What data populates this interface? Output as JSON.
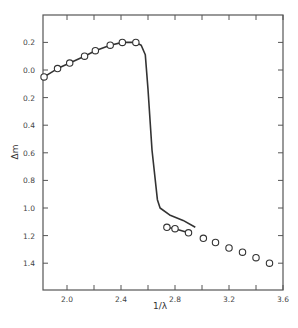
{
  "chart_data": {
    "type": "line",
    "title": "",
    "xlabel": "1/λ",
    "ylabel": "Δm",
    "xlim": [
      1.82,
      3.6
    ],
    "ylim": [
      -0.4,
      1.6
    ],
    "y_inverted": true,
    "grid": false,
    "legend": null,
    "x_ticks": [
      2.0,
      2.2,
      2.4,
      2.6,
      2.8,
      3.0,
      3.2,
      3.4,
      3.6
    ],
    "x_tick_labels": [
      "2.0",
      "2.4",
      "2.8",
      "3.2",
      "3.6"
    ],
    "y_ticks": [
      -0.2,
      0.0,
      0.2,
      0.4,
      0.6,
      0.8,
      1.0,
      1.2,
      1.4
    ],
    "y_tick_labels": [
      "0.2",
      "0.0",
      "0.2",
      "0.4",
      "0.6",
      "0.8",
      "1.0",
      "1.2",
      "1.4"
    ],
    "series": [
      {
        "name": "observed-points",
        "style": "open-circles",
        "x": [
          1.83,
          1.93,
          2.02,
          2.13,
          2.21,
          2.32,
          2.41,
          2.51,
          2.74,
          2.8,
          2.9,
          3.01,
          3.1,
          3.2,
          3.3,
          3.4,
          3.5
        ],
        "y": [
          0.05,
          -0.01,
          -0.05,
          -0.1,
          -0.14,
          -0.18,
          -0.2,
          -0.2,
          1.14,
          1.15,
          1.18,
          1.22,
          1.25,
          1.29,
          1.32,
          1.36,
          1.4
        ]
      },
      {
        "name": "fit-curve-low",
        "style": "solid-line",
        "x": [
          1.83,
          1.93,
          2.02,
          2.13,
          2.21,
          2.32,
          2.41,
          2.51
        ],
        "y": [
          0.05,
          -0.01,
          -0.05,
          -0.1,
          -0.14,
          -0.18,
          -0.2,
          -0.2
        ]
      },
      {
        "name": "model-curve",
        "style": "solid-line",
        "x": [
          2.51,
          2.55,
          2.58,
          2.6,
          2.63,
          2.67,
          2.69,
          2.76,
          2.86,
          2.95
        ],
        "y": [
          -0.2,
          -0.18,
          -0.11,
          0.14,
          0.58,
          0.94,
          1.0,
          1.05,
          1.09,
          1.14
        ]
      },
      {
        "name": "fit-curve-high",
        "style": "solid-line",
        "x": [
          2.74,
          2.8,
          2.9
        ],
        "y": [
          1.14,
          1.15,
          1.18
        ]
      }
    ]
  },
  "labels": {
    "xlabel": "1/λ",
    "ylabel": "Δm"
  }
}
